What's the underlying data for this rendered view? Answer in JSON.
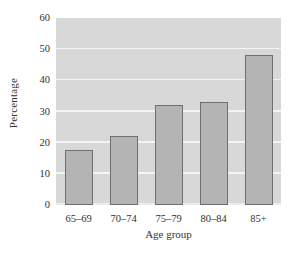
{
  "chart_data": {
    "type": "bar",
    "title": "",
    "subtitle": "",
    "xlabel": "Age group",
    "ylabel": "Percentage",
    "categories": [
      "65–69",
      "70–74",
      "75–79",
      "80–84",
      "85+"
    ],
    "values": [
      17.5,
      22,
      32,
      33,
      48
    ],
    "series": [
      {
        "name": "Percentage",
        "values": [
          17.5,
          22,
          32,
          33,
          48
        ]
      }
    ],
    "ylim": [
      0,
      60
    ],
    "yticks": [
      0,
      10,
      20,
      30,
      40,
      50,
      60
    ],
    "ytick_labels": [
      "0",
      "10",
      "20",
      "30",
      "40",
      "50",
      "60"
    ],
    "xtick_labels": [
      "65–69",
      "70–74",
      "75–79",
      "80–84",
      "85+"
    ],
    "grid": "horizontal-only",
    "legend": "none",
    "colors": {
      "bar_fill": "#b4b4b4",
      "bar_edge": "#6f6f6f",
      "plot_background": "#d8d8d8",
      "gridline": "#f4f4f4",
      "figure_background": "#ffffff",
      "text": "#303030"
    }
  }
}
